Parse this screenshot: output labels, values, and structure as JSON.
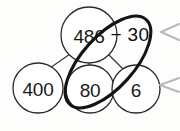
{
  "diagram": {
    "background_color": "#fdfdfc",
    "ink_color": "#1a1a1a",
    "highlight_color": "#141414",
    "caret_color": "#b9b9b9",
    "nodes": [
      {
        "id": "root",
        "label": "486",
        "cx": 89,
        "cy": 35,
        "r": 28
      },
      {
        "id": "hundreds",
        "label": "400",
        "cx": 38,
        "cy": 88,
        "r": 25
      },
      {
        "id": "tens",
        "label": "80",
        "cx": 90,
        "cy": 89,
        "r": 24
      },
      {
        "id": "ones",
        "label": "6",
        "cx": 136,
        "cy": 89,
        "r": 24
      }
    ],
    "annotation": {
      "id": "subtract",
      "label": "− 30",
      "x": 130,
      "y": 34
    },
    "connectors": [
      {
        "id": "root-to-hundreds",
        "x1": 70,
        "y1": 54,
        "x2": 50,
        "y2": 68
      },
      {
        "id": "root-to-tens",
        "x1": 89,
        "y1": 63,
        "x2": 90,
        "y2": 68
      },
      {
        "id": "root-to-ones",
        "x1": 108,
        "y1": 54,
        "x2": 124,
        "y2": 69
      }
    ],
    "group_ellipse": {
      "id": "tens-and-minus-30-group",
      "cx": 108,
      "cy": 62,
      "rx": 57,
      "ry": 26,
      "rotation_deg": -48
    },
    "caret_marks": [
      {
        "id": "caret-upper",
        "points": "179,24 161,32 179,40"
      },
      {
        "id": "caret-lower",
        "points": "179,78 160,85 179,92"
      }
    ]
  }
}
